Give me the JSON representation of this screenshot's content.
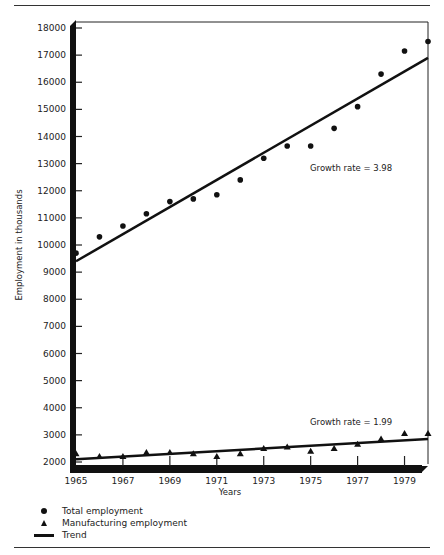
{
  "chart_data": {
    "type": "scatter",
    "title": "",
    "xlabel": "Years",
    "ylabel": "Employment in thousands",
    "xlim": [
      1965,
      1980
    ],
    "ylim": [
      2000,
      18000
    ],
    "x_ticks": [
      "1965",
      "1967",
      "1969",
      "1971",
      "1973",
      "1975",
      "1977",
      "1979"
    ],
    "y_ticks": [
      "18000",
      "17000",
      "16000",
      "15000",
      "14000",
      "13000",
      "12000",
      "11000",
      "10000",
      "9000",
      "8000",
      "7000",
      "6000",
      "5000",
      "4000",
      "3000",
      "2000"
    ],
    "x": [
      1965,
      1966,
      1967,
      1968,
      1969,
      1970,
      1971,
      1972,
      1973,
      1974,
      1975,
      1976,
      1977,
      1978,
      1979,
      1980
    ],
    "series": [
      {
        "name": "Total employment",
        "marker": "circle",
        "values": [
          9700,
          10300,
          10700,
          11150,
          11600,
          11700,
          11850,
          12400,
          13200,
          13650,
          13650,
          14300,
          15100,
          16300,
          17150,
          17500
        ]
      },
      {
        "name": "Manufacturing employment",
        "marker": "triangle",
        "values": [
          2300,
          2200,
          2200,
          2350,
          2350,
          2300,
          2200,
          2300,
          2500,
          2550,
          2400,
          2500,
          2650,
          2850,
          3050,
          3050
        ]
      }
    ],
    "trends": [
      {
        "name": "Total employment trend",
        "x": [
          1965,
          1980
        ],
        "y": [
          9400,
          16900
        ],
        "label": "Growth rate = 3.98"
      },
      {
        "name": "Manufacturing employment trend",
        "x": [
          1965,
          1980
        ],
        "y": [
          2100,
          2850
        ],
        "label": "Growth rate = 1.99"
      }
    ],
    "annotations": [
      "Growth rate = 3.98",
      "Growth rate = 1.99"
    ],
    "legend": [
      "Total employment",
      "Manufacturing employment",
      "Trend"
    ],
    "legend_position": "bottom-left",
    "grid": false
  },
  "labels": {
    "ylabel": "Employment in thousands",
    "xlabel": "Years",
    "growth_total": "Growth rate = 3.98",
    "growth_mfg": "Growth rate = 1.99"
  },
  "legend": {
    "total": "Total employment",
    "manufacturing": "Manufacturing employment",
    "trend": "Trend"
  }
}
